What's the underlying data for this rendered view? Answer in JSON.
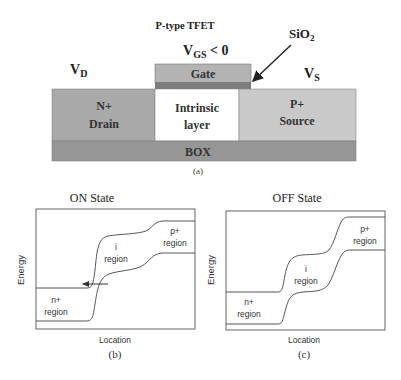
{
  "structure": {
    "title": "P-type TFET",
    "vgs_label_main": "V",
    "vgs_label_sub": "GS",
    "vgs_label_rest": " < 0",
    "vd_main": "V",
    "vd_sub": "D",
    "vs_main": "V",
    "vs_sub": "S",
    "oxide_main": "SiO",
    "oxide_sub": "2",
    "gate_label": "Gate",
    "drain_line1": "N+",
    "drain_line2": "Drain",
    "intrinsic_line1": "Intrinsic",
    "intrinsic_line2": "layer",
    "source_line1": "P+",
    "source_line2": "Source",
    "box_label": "BOX",
    "caption": "(a)",
    "colors": {
      "drain": "#a9a9a9",
      "intrinsic": "#ffffff",
      "source": "#c9c9c9",
      "gate": "#b3b3b3",
      "oxide": "#7c7c7c",
      "box": "#969696"
    }
  },
  "on_state": {
    "title": "ON State",
    "ylabel": "Energy",
    "xlabel": "Location",
    "caption": "(b)",
    "region_n_line1": "n+",
    "region_n_line2": "region",
    "region_i_line1": "i",
    "region_i_line2": "region",
    "region_p_line1": "p+",
    "region_p_line2": "region"
  },
  "off_state": {
    "title": "OFF State",
    "ylabel": "Energy",
    "xlabel": "Location",
    "caption": "(c)",
    "region_n_line1": "n+",
    "region_n_line2": "region",
    "region_i_line1": "i",
    "region_i_line2": "region",
    "region_p_line1": "p+",
    "region_p_line2": "region"
  }
}
